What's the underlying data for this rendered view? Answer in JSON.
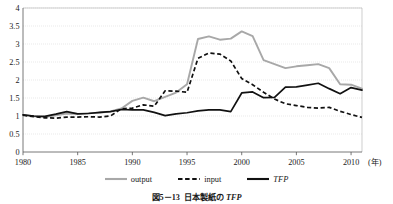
{
  "caption": {
    "figure_number": "図5－13",
    "body": "日本製紙の",
    "tfp": "TFP"
  },
  "legend": {
    "position": "bottom-center",
    "items": [
      {
        "label": "output",
        "color": "#a8a8a8",
        "style": "solid",
        "icon": "line-swatch-solid-gray-icon"
      },
      {
        "label": "input",
        "color": "#111111",
        "style": "dashed",
        "icon": "line-swatch-dashed-black-icon"
      },
      {
        "label": "TFP",
        "color": "#111111",
        "style": "solid",
        "icon": "line-swatch-solid-black-icon"
      }
    ]
  },
  "axes": {
    "x_unit_label": "(年)",
    "y_ticks": [
      "0",
      "0.5",
      "1",
      "1.5",
      "2",
      "2.5",
      "3",
      "3.5",
      "4"
    ],
    "x_ticks": [
      "1980",
      "1985",
      "1990",
      "1995",
      "2000",
      "2005",
      "2010"
    ]
  },
  "chart_data": {
    "type": "line",
    "xlabel": "(年)",
    "ylabel": "",
    "xlim": [
      1980,
      2011
    ],
    "ylim": [
      0,
      4
    ],
    "ytick_step": 0.5,
    "xtick_step": 5,
    "grid": true,
    "grid_axis": "y",
    "legend_position": "bottom-center",
    "x": [
      1980,
      1981,
      1982,
      1983,
      1984,
      1985,
      1986,
      1987,
      1988,
      1989,
      1990,
      1991,
      1992,
      1993,
      1994,
      1995,
      1996,
      1997,
      1998,
      1999,
      2000,
      2001,
      2002,
      2003,
      2004,
      2005,
      2006,
      2007,
      2008,
      2009,
      2010,
      2011
    ],
    "series": [
      {
        "name": "output",
        "color": "#a8a8a8",
        "style": "solid",
        "values": [
          1.03,
          0.99,
          0.97,
          1.02,
          1.07,
          1.06,
          1.08,
          1.09,
          1.13,
          1.21,
          1.42,
          1.51,
          1.41,
          1.53,
          1.65,
          1.88,
          3.14,
          3.21,
          3.12,
          3.15,
          3.35,
          3.22,
          2.55,
          2.44,
          2.33,
          2.38,
          2.41,
          2.44,
          2.33,
          1.88,
          1.87,
          1.76
        ]
      },
      {
        "name": "input",
        "color": "#111111",
        "style": "dashed",
        "values": [
          1.02,
          0.98,
          0.95,
          0.94,
          0.97,
          0.97,
          0.98,
          0.97,
          1.0,
          1.2,
          1.22,
          1.31,
          1.27,
          1.7,
          1.69,
          1.66,
          2.6,
          2.75,
          2.72,
          2.53,
          2.04,
          1.87,
          1.66,
          1.47,
          1.34,
          1.29,
          1.24,
          1.22,
          1.24,
          1.13,
          1.04,
          0.96
        ]
      },
      {
        "name": "TFP",
        "color": "#111111",
        "style": "solid",
        "values": [
          1.03,
          1.0,
          0.99,
          1.05,
          1.12,
          1.06,
          1.07,
          1.1,
          1.12,
          1.18,
          1.17,
          1.17,
          1.1,
          1.01,
          1.06,
          1.09,
          1.14,
          1.17,
          1.17,
          1.12,
          1.64,
          1.67,
          1.51,
          1.52,
          1.8,
          1.81,
          1.86,
          1.91,
          1.76,
          1.62,
          1.79,
          1.72
        ]
      }
    ]
  }
}
